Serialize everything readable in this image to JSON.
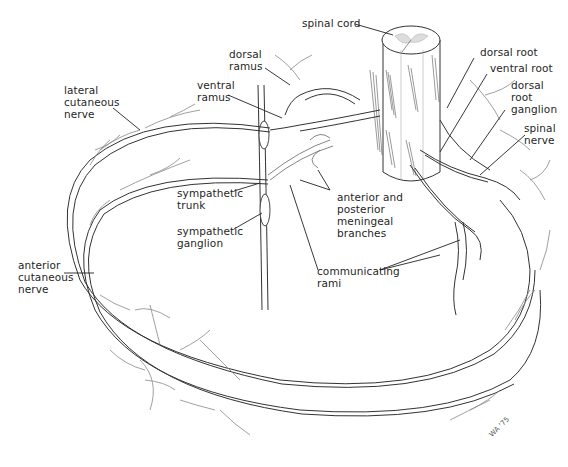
{
  "figure": {
    "signature": "WA '75"
  },
  "labels": {
    "spinal_cord": "spinal cord",
    "dorsal_ramus": "dorsal\nramus",
    "ventral_ramus": "ventral\nramus",
    "lateral_cutaneous_nerve": "lateral\ncutaneous\nnerve",
    "dorsal_root": "dorsal root",
    "ventral_root": "ventral root",
    "dorsal_root_ganglion": "dorsal\nroot\nganglion",
    "spinal_nerve": "spinal\nnerve",
    "sympathetic_trunk": "sympathetic\ntrunk",
    "sympathetic_ganglion": "sympathetic\nganglion",
    "meningeal_branches": "anterior and\nposterior\nmeningeal\nbranches",
    "anterior_cutaneous_nerve": "anterior\ncutaneous\nnerve",
    "communicating_rami": "communicating\nrami"
  }
}
